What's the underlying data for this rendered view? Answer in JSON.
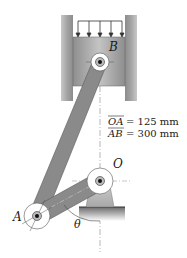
{
  "labels": {
    "point_B": "B",
    "point_O": "O",
    "point_A": "A",
    "angle": "θ"
  },
  "dimensions": [
    {
      "name": "OA",
      "text": "OA",
      "value": "= 125 mm"
    },
    {
      "name": "AB",
      "text": "AB",
      "value": "= 300 mm"
    }
  ],
  "colors": {
    "link": "#8a8a8a",
    "link_dark": "#6e6e6e",
    "cylinder_wall": "#b0b0b0",
    "piston": "#a8a8a8",
    "mount": "#b8b8b8",
    "ground": "#9a9a9a"
  }
}
